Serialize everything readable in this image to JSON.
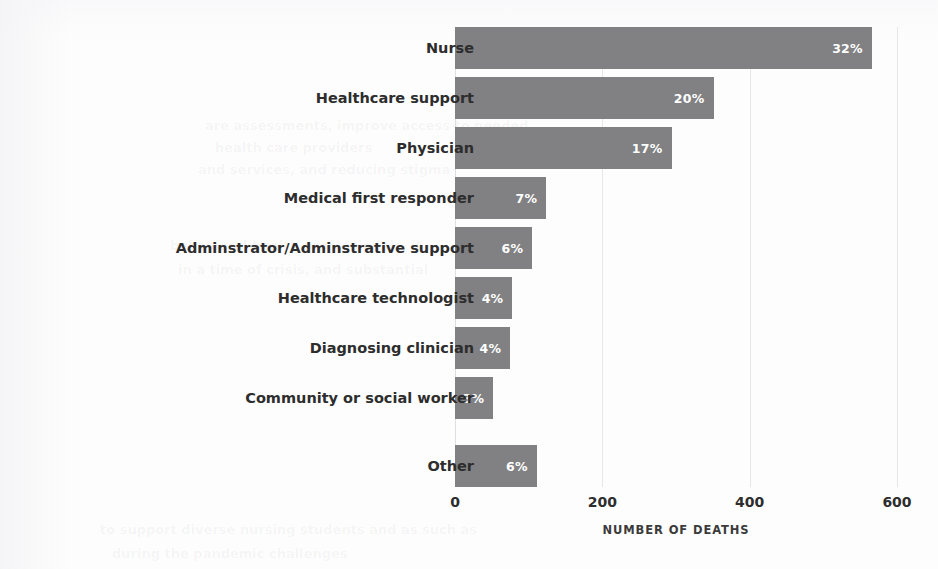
{
  "chart_data": {
    "type": "bar",
    "orientation": "horizontal",
    "title": "",
    "xlabel": "NUMBER OF DEATHS",
    "ylabel": "OCCUPATION",
    "xlim": [
      0,
      600
    ],
    "xticks": [
      "0",
      "200",
      "400",
      "600"
    ],
    "xtick_values": [
      0,
      200,
      400,
      600
    ],
    "grid": true,
    "legend": null,
    "bar_color": "#818183",
    "data_label_color": "#ffffff",
    "categories": [
      "Nurse",
      "Healthcare support",
      "Physician",
      "Medical first responder",
      "Adminstrator/Adminstrative support",
      "Healthcare technologist",
      "Diagnosing clinician",
      "Community or social worker",
      "Other"
    ],
    "values": [
      566,
      351,
      294,
      124,
      105,
      78,
      75,
      52,
      111
    ],
    "data_labels": [
      "32%",
      "20%",
      "17%",
      "7%",
      "6%",
      "4%",
      "4%",
      "3%",
      "6%"
    ]
  },
  "axes": {
    "y_title": "OCCUPATION",
    "x_title": "NUMBER OF DEATHS"
  },
  "ghost_text": {
    "line1": "are assessments, improve access to needed",
    "line2": "health care providers",
    "line3": "and services, and reducing stigma",
    "line4": "behavioral health professionals, it",
    "line5": "in a time of crisis, and substantial",
    "line6": "to support diverse nursing students and as such as",
    "line7": "during the pandemic challenges"
  }
}
